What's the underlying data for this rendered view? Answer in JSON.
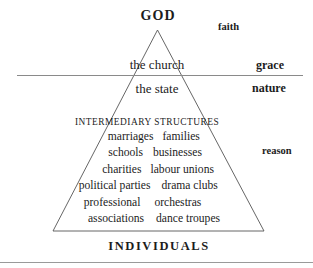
{
  "figure": {
    "apex_label": "GOD",
    "base_label": "INDIVIDUALS",
    "tier_church": "the church",
    "tier_state": "the state",
    "intermediary_caption": "INTERMEDIARY STRUCTURES",
    "side_labels": {
      "faith": "faith",
      "grace": "grace",
      "nature": "nature",
      "reason": "reason"
    },
    "structures": [
      {
        "left": "marriages",
        "right": "families"
      },
      {
        "left": "schools",
        "right": "businesses"
      },
      {
        "left": "charities",
        "right": "labour unions"
      },
      {
        "left": "political parties",
        "right": "drama clubs"
      },
      {
        "left": "professional",
        "right": "orchestras"
      },
      {
        "left": "associations",
        "right": "dance troupes"
      }
    ],
    "colors": {
      "ink": "#1c1c1c",
      "rule": "#8a8a8a",
      "triangle_stroke": "#555555",
      "background": "#ffffff"
    }
  }
}
